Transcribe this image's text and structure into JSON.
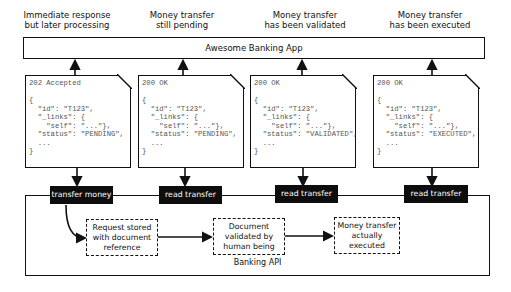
{
  "captions": [
    {
      "text": "Immediate response\nbut later processing"
    },
    {
      "text": "Money transfer\nstill pending"
    },
    {
      "text": "Money transfer\nhas been validated"
    },
    {
      "text": "Money transfer\nhas been executed"
    }
  ],
  "app": {
    "label": "Awesome Banking App"
  },
  "responses": [
    {
      "status": "202 Accepted",
      "body": "{\n  \"id\": \"T123\",\n  \"_links\": {\n    \"self\": \"...\"},\n  \"status\": \"PENDING\",\n  ...\n}"
    },
    {
      "status": "200 OK",
      "body": "{\n  \"id\": \"T123\",\n  \"_links\": {\n    \"self\": \"...\"},\n  \"status\": \"PENDING\",\n  ...\n}"
    },
    {
      "status": "200 OK",
      "body": "{\n  \"id\": \"T123\",\n  \"_links\": {\n    \"self\": \"...\"},\n  \"status\": \"VALIDATED\",\n  ...\n}"
    },
    {
      "status": "200 OK",
      "body": "{\n  \"id\": \"T123\",\n  \"_links\": {\n    \"self\": \"...\"},\n  \"status\": \"EXECUTED\",\n  ...\n}"
    }
  ],
  "operations": [
    {
      "label": "transfer money"
    },
    {
      "label": "read transfer"
    },
    {
      "label": "read transfer"
    },
    {
      "label": "read transfer"
    }
  ],
  "api": {
    "label": "Banking API"
  },
  "steps": [
    {
      "text": "Request stored\nwith document\nreference"
    },
    {
      "text": "Document\nvalidated by\nhuman being"
    },
    {
      "text": "Money transfer\nactually\nexecuted"
    }
  ]
}
